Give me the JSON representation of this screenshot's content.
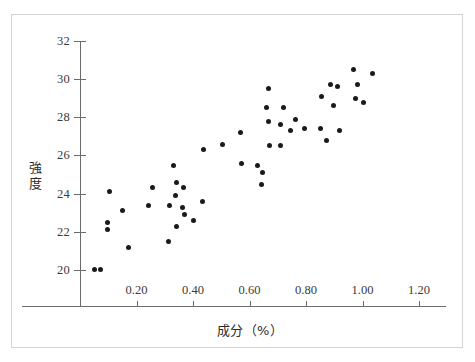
{
  "figure": {
    "background": "#ffffff",
    "frame_color": "#d4d4d4",
    "axis_color": "#6b6b6b",
    "point_color": "#1a1a1a"
  },
  "chart_data": {
    "type": "scatter",
    "title": "",
    "xlabel": "成分（%）",
    "ylabel": "強度",
    "xlim": [
      0.0,
      1.3
    ],
    "ylim": [
      19.2,
      32.0
    ],
    "xticks": [
      0.2,
      0.4,
      0.6,
      0.8,
      1.0,
      1.2
    ],
    "xtick_labels": [
      "0.20",
      "0.40",
      "0.60",
      "0.80",
      "1.00",
      "1.20"
    ],
    "yticks": [
      20,
      22,
      24,
      26,
      28,
      30,
      32
    ],
    "ytick_labels": [
      "20",
      "22",
      "24",
      "26",
      "28",
      "30",
      "32"
    ],
    "grid": false,
    "legend": null,
    "points": [
      {
        "x": 0.053,
        "y": 20.0
      },
      {
        "x": 0.071,
        "y": 20.0
      },
      {
        "x": 0.096,
        "y": 22.1
      },
      {
        "x": 0.099,
        "y": 22.5
      },
      {
        "x": 0.103,
        "y": 24.1
      },
      {
        "x": 0.152,
        "y": 23.1
      },
      {
        "x": 0.173,
        "y": 21.2
      },
      {
        "x": 0.241,
        "y": 23.4
      },
      {
        "x": 0.255,
        "y": 24.3
      },
      {
        "x": 0.313,
        "y": 21.5
      },
      {
        "x": 0.318,
        "y": 23.4
      },
      {
        "x": 0.332,
        "y": 25.5
      },
      {
        "x": 0.339,
        "y": 23.9
      },
      {
        "x": 0.34,
        "y": 22.3
      },
      {
        "x": 0.343,
        "y": 24.6
      },
      {
        "x": 0.363,
        "y": 23.3
      },
      {
        "x": 0.365,
        "y": 24.3
      },
      {
        "x": 0.371,
        "y": 22.9
      },
      {
        "x": 0.401,
        "y": 22.6
      },
      {
        "x": 0.435,
        "y": 23.6
      },
      {
        "x": 0.436,
        "y": 26.3
      },
      {
        "x": 0.505,
        "y": 26.6
      },
      {
        "x": 0.569,
        "y": 27.2
      },
      {
        "x": 0.573,
        "y": 25.6
      },
      {
        "x": 0.63,
        "y": 25.5
      },
      {
        "x": 0.644,
        "y": 24.5
      },
      {
        "x": 0.647,
        "y": 25.1
      },
      {
        "x": 0.661,
        "y": 28.5
      },
      {
        "x": 0.667,
        "y": 29.5
      },
      {
        "x": 0.669,
        "y": 27.8
      },
      {
        "x": 0.672,
        "y": 26.5
      },
      {
        "x": 0.71,
        "y": 26.5
      },
      {
        "x": 0.711,
        "y": 27.6
      },
      {
        "x": 0.719,
        "y": 28.5
      },
      {
        "x": 0.746,
        "y": 27.3
      },
      {
        "x": 0.763,
        "y": 27.9
      },
      {
        "x": 0.796,
        "y": 27.4
      },
      {
        "x": 0.853,
        "y": 27.4
      },
      {
        "x": 0.854,
        "y": 29.1
      },
      {
        "x": 0.874,
        "y": 26.8
      },
      {
        "x": 0.886,
        "y": 29.7
      },
      {
        "x": 0.899,
        "y": 28.6
      },
      {
        "x": 0.912,
        "y": 29.6
      },
      {
        "x": 0.919,
        "y": 27.3
      },
      {
        "x": 0.967,
        "y": 30.5
      },
      {
        "x": 0.975,
        "y": 29.0
      },
      {
        "x": 0.982,
        "y": 29.7
      },
      {
        "x": 1.002,
        "y": 28.8
      },
      {
        "x": 1.035,
        "y": 30.3
      }
    ]
  }
}
